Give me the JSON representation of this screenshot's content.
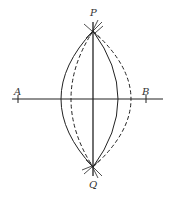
{
  "diagram": {
    "points": {
      "A": {
        "label": "A"
      },
      "B": {
        "label": "B"
      },
      "P": {
        "label": "P"
      },
      "Q": {
        "label": "Q"
      }
    },
    "elements": [
      {
        "type": "segment",
        "name": "line-AB",
        "style": "solid"
      },
      {
        "type": "segment",
        "name": "line-PQ",
        "style": "solid"
      },
      {
        "type": "arc",
        "name": "arc-left-solid",
        "style": "solid"
      },
      {
        "type": "arc",
        "name": "arc-right-solid",
        "style": "solid"
      },
      {
        "type": "arc",
        "name": "arc-left-dashed",
        "style": "dashed"
      },
      {
        "type": "arc",
        "name": "arc-right-dashed",
        "style": "dashed"
      }
    ]
  }
}
